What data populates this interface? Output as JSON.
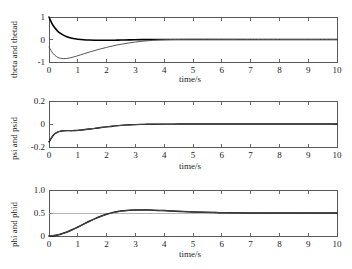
{
  "figure": {
    "background": "#ffffff",
    "axis_color": "#5a5a5a",
    "curve_primary_color": "#000000",
    "curve_secondary_color": "#555555"
  },
  "chart_data": [
    {
      "type": "line",
      "id": "theta",
      "title": "",
      "xlabel": "time/s",
      "ylabel": "theta and thetad",
      "xlim": [
        0,
        10
      ],
      "ylim": [
        -1,
        1
      ],
      "xticks": [
        0,
        1,
        2,
        3,
        4,
        5,
        6,
        7,
        8,
        9,
        10
      ],
      "xticklabels": [
        "0",
        "1",
        "2",
        "3",
        "4",
        "5",
        "6",
        "7",
        "8",
        "9",
        "10"
      ],
      "yticks": [
        -1,
        0,
        1
      ],
      "yticklabels": [
        "-1",
        "0",
        "1"
      ],
      "grid": false,
      "legend": "none",
      "series": [
        {
          "name": "theta",
          "color": "#000000",
          "width": 1.6,
          "x": [
            0,
            0.1,
            0.2,
            0.3,
            0.4,
            0.5,
            0.6,
            0.7,
            0.8,
            0.9,
            1.0,
            1.2,
            1.4,
            1.6,
            1.8,
            2.0,
            2.2,
            2.4,
            2.6,
            2.8,
            3.0,
            3.2,
            3.4,
            3.6,
            3.8,
            4.0,
            4.3,
            4.6,
            5.0,
            5.5,
            6.0,
            6.5,
            7.0,
            8.0,
            9.0,
            10.0
          ],
          "y": [
            1.0,
            0.72,
            0.52,
            0.375,
            0.27,
            0.195,
            0.135,
            0.09,
            0.055,
            0.03,
            0.012,
            -0.012,
            -0.025,
            -0.032,
            -0.035,
            -0.035,
            -0.032,
            -0.028,
            -0.022,
            -0.016,
            -0.011,
            -0.007,
            -0.004,
            -0.002,
            0.0,
            0.001,
            0.002,
            0.002,
            0.002,
            0.001,
            0.001,
            0.0,
            0.0,
            0.0,
            0.0,
            0.0
          ]
        },
        {
          "name": "thetad",
          "color": "#555555",
          "width": 1.0,
          "x": [
            0,
            0.1,
            0.2,
            0.3,
            0.4,
            0.5,
            0.6,
            0.7,
            0.8,
            0.9,
            1.0,
            1.2,
            1.4,
            1.6,
            1.8,
            2.0,
            2.2,
            2.4,
            2.6,
            2.8,
            3.0,
            3.2,
            3.4,
            3.6,
            3.8,
            4.0,
            4.3,
            4.6,
            5.0,
            5.5,
            6.0,
            6.5,
            7.0,
            8.0,
            9.0,
            10.0
          ],
          "y": [
            -0.33,
            -0.55,
            -0.7,
            -0.79,
            -0.835,
            -0.85,
            -0.845,
            -0.825,
            -0.795,
            -0.76,
            -0.72,
            -0.64,
            -0.56,
            -0.485,
            -0.415,
            -0.35,
            -0.29,
            -0.235,
            -0.19,
            -0.148,
            -0.112,
            -0.082,
            -0.058,
            -0.039,
            -0.024,
            -0.013,
            -0.002,
            0.004,
            0.007,
            0.006,
            0.004,
            0.002,
            0.001,
            0.0,
            0.0,
            0.0
          ]
        }
      ]
    },
    {
      "type": "line",
      "id": "psi",
      "title": "",
      "xlabel": "time/s",
      "ylabel": "psi and psid",
      "xlim": [
        0,
        10
      ],
      "ylim": [
        -0.2,
        0.2
      ],
      "xticks": [
        0,
        1,
        2,
        3,
        4,
        5,
        6,
        7,
        8,
        9,
        10
      ],
      "xticklabels": [
        "0",
        "1",
        "2",
        "3",
        "4",
        "5",
        "6",
        "7",
        "8",
        "9",
        "10"
      ],
      "yticks": [
        -0.2,
        0,
        0.2
      ],
      "yticklabels": [
        "-0.2",
        "0",
        "0.2"
      ],
      "grid": false,
      "legend": "none",
      "series": [
        {
          "name": "psi",
          "color": "#000000",
          "width": 1.4,
          "x": [
            0,
            0.05,
            0.1,
            0.15,
            0.2,
            0.3,
            0.4,
            0.5,
            0.6,
            0.7,
            0.8,
            0.9,
            1.0,
            1.2,
            1.4,
            1.6,
            1.8,
            2.0,
            2.2,
            2.4,
            2.6,
            2.8,
            3.0,
            3.3,
            3.6,
            4.0,
            4.5,
            5.0,
            6.0,
            7.0,
            8.0,
            9.0,
            10.0
          ],
          "y": [
            -0.155,
            -0.135,
            -0.115,
            -0.098,
            -0.085,
            -0.07,
            -0.062,
            -0.059,
            -0.058,
            -0.058,
            -0.058,
            -0.057,
            -0.055,
            -0.05,
            -0.044,
            -0.038,
            -0.031,
            -0.025,
            -0.019,
            -0.014,
            -0.01,
            -0.007,
            -0.005,
            -0.003,
            -0.002,
            -0.001,
            -0.0005,
            0.0,
            0.0,
            0.0,
            0.0,
            0.0,
            0.0
          ]
        },
        {
          "name": "psid",
          "color": "#555555",
          "width": 0.9,
          "x": [
            0,
            0.05,
            0.1,
            0.2,
            0.4,
            0.6,
            0.8,
            1.0,
            1.4,
            1.8,
            2.2,
            2.6,
            3.0,
            3.6,
            4.2,
            5.0,
            6.0,
            7.0,
            8.0,
            9.0,
            10.0
          ],
          "y": [
            -0.15,
            -0.132,
            -0.113,
            -0.084,
            -0.062,
            -0.058,
            -0.058,
            -0.055,
            -0.044,
            -0.031,
            -0.019,
            -0.01,
            -0.005,
            -0.002,
            -0.001,
            0.0,
            0.0,
            0.0,
            0.0,
            0.0,
            0.0
          ]
        }
      ]
    },
    {
      "type": "line",
      "id": "phi",
      "title": "",
      "xlabel": "time/s",
      "ylabel": "phi and phid",
      "xlim": [
        0,
        10
      ],
      "ylim": [
        0,
        1.0
      ],
      "xticks": [
        0,
        1,
        2,
        3,
        4,
        5,
        6,
        7,
        8,
        9,
        10
      ],
      "xticklabels": [
        "0",
        "1",
        "2",
        "3",
        "4",
        "5",
        "6",
        "7",
        "8",
        "9",
        "10"
      ],
      "yticks": [
        0,
        0.5,
        1.0
      ],
      "yticklabels": [
        "0",
        "0.5",
        "1.0"
      ],
      "grid": false,
      "legend": "none",
      "reference_line": 0.5,
      "series": [
        {
          "name": "phi",
          "color": "#000000",
          "width": 1.5,
          "x": [
            0,
            0.2,
            0.4,
            0.6,
            0.8,
            1.0,
            1.2,
            1.4,
            1.6,
            1.8,
            2.0,
            2.2,
            2.4,
            2.6,
            2.8,
            3.0,
            3.2,
            3.5,
            3.8,
            4.0,
            4.3,
            4.6,
            5.0,
            5.4,
            5.8,
            6.2,
            7.0,
            8.0,
            9.0,
            10.0
          ],
          "y": [
            0.0,
            0.012,
            0.04,
            0.082,
            0.135,
            0.195,
            0.258,
            0.32,
            0.378,
            0.43,
            0.473,
            0.508,
            0.533,
            0.55,
            0.56,
            0.565,
            0.566,
            0.563,
            0.557,
            0.552,
            0.543,
            0.534,
            0.523,
            0.515,
            0.509,
            0.506,
            0.502,
            0.5,
            0.5,
            0.5
          ]
        },
        {
          "name": "phid",
          "color": "#555555",
          "width": 0.9,
          "x": [
            0,
            0.4,
            0.8,
            1.2,
            1.6,
            2.0,
            2.4,
            2.8,
            3.2,
            3.6,
            4.0,
            4.5,
            5.0,
            5.6,
            6.4,
            7.5,
            8.5,
            10.0
          ],
          "y": [
            0.0,
            0.038,
            0.132,
            0.255,
            0.375,
            0.47,
            0.53,
            0.558,
            0.564,
            0.56,
            0.551,
            0.539,
            0.523,
            0.511,
            0.504,
            0.501,
            0.5,
            0.5
          ]
        }
      ]
    }
  ]
}
